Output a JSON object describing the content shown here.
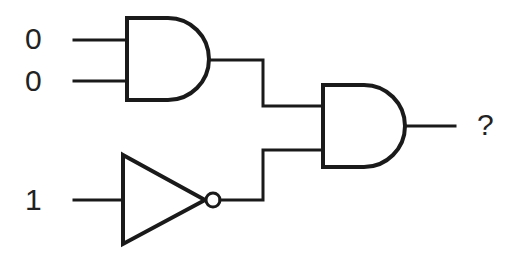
{
  "diagram": {
    "type": "logic-circuit",
    "inputs": [
      {
        "id": "in_a",
        "label": "0"
      },
      {
        "id": "in_b",
        "label": "0"
      },
      {
        "id": "in_c",
        "label": "1"
      }
    ],
    "gates": [
      {
        "id": "and1",
        "type": "AND",
        "inputs": [
          "in_a",
          "in_b"
        ]
      },
      {
        "id": "not1",
        "type": "NOT",
        "inputs": [
          "in_c"
        ]
      },
      {
        "id": "and2",
        "type": "AND",
        "inputs": [
          "and1",
          "not1"
        ]
      }
    ],
    "output": {
      "id": "out",
      "label": "?",
      "source": "and2"
    },
    "colors": {
      "stroke": "#1a1a1a",
      "background": "#ffffff",
      "text": "#222222"
    }
  }
}
